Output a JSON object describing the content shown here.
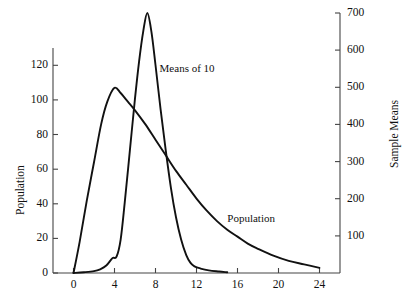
{
  "chart_data": {
    "type": "line",
    "title": "",
    "subtitle": "",
    "xlabel": "",
    "ylabel": "Population",
    "y2label": "Sample Means",
    "xlim": [
      -2,
      26
    ],
    "ylim": [
      0,
      130
    ],
    "y2lim": [
      0,
      700
    ],
    "grid": false,
    "legend_position": "inline-annotation",
    "x_ticks": [
      "0",
      "4",
      "8",
      "12",
      "16",
      "20",
      "24"
    ],
    "x_tick_values": [
      0,
      4,
      8,
      12,
      16,
      20,
      24
    ],
    "y_ticks": [
      "0",
      "20",
      "40",
      "60",
      "80",
      "100",
      "120"
    ],
    "y_tick_values": [
      0,
      20,
      40,
      60,
      80,
      100,
      120
    ],
    "y2_ticks": [
      "100",
      "200",
      "300",
      "400",
      "500",
      "600",
      "700"
    ],
    "y2_tick_values": [
      100,
      200,
      300,
      400,
      500,
      600,
      700
    ],
    "annotations": [
      {
        "text": "Means of 10",
        "x": 8.4,
        "y": 118
      },
      {
        "text": "Population",
        "x": 15.0,
        "y": 31
      }
    ],
    "series": [
      {
        "name": "Population",
        "axis": "left",
        "color": "#111111",
        "x": [
          0.0,
          0.6,
          1.3,
          2.0,
          2.7,
          3.3,
          4.0,
          4.6,
          5.3,
          6.0,
          7.0,
          8.0,
          9.0,
          10.0,
          11.0,
          12.0,
          13.0,
          14.0,
          15.0,
          16.0,
          17.0,
          18.0,
          19.5,
          21.0,
          22.5,
          24.0
        ],
        "values": [
          0,
          18,
          42,
          64,
          86,
          99,
          107,
          104,
          99,
          94,
          86,
          77,
          68,
          59,
          51,
          43,
          36,
          30,
          25,
          21,
          17,
          14,
          10,
          7,
          5,
          3
        ]
      },
      {
        "name": "Means of 10",
        "axis": "right",
        "color": "#111111",
        "x": [
          0.0,
          1.0,
          2.0,
          2.6,
          3.2,
          3.8,
          4.2,
          4.6,
          5.0,
          5.5,
          6.0,
          6.4,
          6.8,
          7.2,
          7.6,
          8.0,
          8.5,
          9.0,
          9.5,
          10.0,
          10.5,
          11.0,
          11.4,
          11.8,
          12.4,
          13.2,
          14.2,
          15.0
        ],
        "values": [
          0,
          2,
          5,
          10,
          20,
          40,
          44,
          90,
          190,
          330,
          470,
          570,
          650,
          700,
          650,
          560,
          440,
          330,
          230,
          150,
          90,
          48,
          28,
          18,
          12,
          7,
          4,
          2
        ]
      }
    ]
  },
  "axes": {
    "left_title": "Population",
    "right_title": "Sample Means"
  }
}
